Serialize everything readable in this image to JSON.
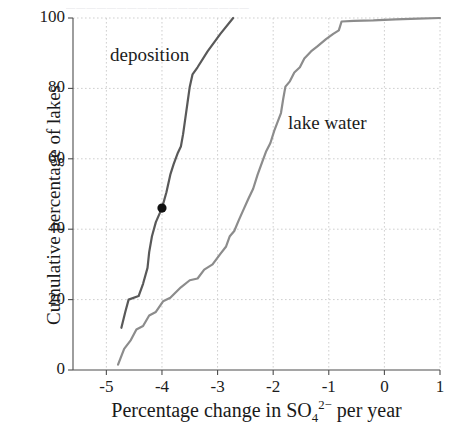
{
  "figure": {
    "top_fragment_text": "▄▄▄▄▄▄▄▄▄▄▄▄▄▄▄▄▄▄"
  },
  "axes": {
    "x_title_prefix": "Percentage change in SO",
    "x_title_sub": "4",
    "x_title_sup": "2−",
    "x_title_suffix": " per year",
    "y_title": "Cumulative percentage of lakes",
    "x_ticks": [
      "-5",
      "-4",
      "-3",
      "-2",
      "-1",
      "0",
      "1"
    ],
    "y_ticks": [
      "0",
      "20",
      "40",
      "60",
      "80",
      "100"
    ]
  },
  "series_labels": {
    "deposition": "deposition",
    "lake_water": "lake water"
  },
  "colors": {
    "deposition": "#595959",
    "lake_water": "#8c8c8c",
    "grid": "#cfcfcf",
    "axis": "#4d4d4d",
    "marker": "#111111",
    "text": "#1c1c1c"
  },
  "chart_data": {
    "type": "line",
    "title": "",
    "xlabel": "Percentage change in SO4 2- per year",
    "ylabel": "Cumulative percentage of lakes",
    "xlim": [
      -5.6,
      1.0
    ],
    "ylim": [
      0,
      100
    ],
    "xticks": [
      -5,
      -4,
      -3,
      -2,
      -1,
      0,
      1
    ],
    "yticks": [
      0,
      20,
      40,
      60,
      80,
      100
    ],
    "grid": true,
    "legend": "inline-annotations",
    "series": [
      {
        "name": "deposition",
        "color": "#595959",
        "points": [
          [
            -4.73,
            12.0
          ],
          [
            -4.66,
            16.5
          ],
          [
            -4.6,
            20.0
          ],
          [
            -4.42,
            21.0
          ],
          [
            -4.34,
            24.5
          ],
          [
            -4.26,
            29.0
          ],
          [
            -4.23,
            33.5
          ],
          [
            -4.18,
            38.0
          ],
          [
            -4.11,
            42.0
          ],
          [
            -4.0,
            46.0
          ],
          [
            -3.92,
            50.5
          ],
          [
            -3.85,
            55.5
          ],
          [
            -3.79,
            58.5
          ],
          [
            -3.72,
            61.5
          ],
          [
            -3.66,
            63.5
          ],
          [
            -3.62,
            67.0
          ],
          [
            -3.58,
            71.5
          ],
          [
            -3.54,
            76.0
          ],
          [
            -3.5,
            80.5
          ],
          [
            -3.45,
            84.0
          ],
          [
            -3.36,
            86.0
          ],
          [
            -3.18,
            90.5
          ],
          [
            -2.95,
            95.5
          ],
          [
            -2.72,
            100.0
          ]
        ],
        "marker_point": [
          -4.0,
          46.0
        ]
      },
      {
        "name": "lake water",
        "color": "#8c8c8c",
        "points": [
          [
            -4.79,
            1.5
          ],
          [
            -4.68,
            6.0
          ],
          [
            -4.56,
            8.5
          ],
          [
            -4.46,
            11.5
          ],
          [
            -4.34,
            12.5
          ],
          [
            -4.23,
            15.5
          ],
          [
            -4.11,
            16.5
          ],
          [
            -3.98,
            19.5
          ],
          [
            -3.85,
            20.5
          ],
          [
            -3.66,
            23.5
          ],
          [
            -3.5,
            25.5
          ],
          [
            -3.36,
            26.0
          ],
          [
            -3.24,
            28.5
          ],
          [
            -3.09,
            30.0
          ],
          [
            -2.95,
            33.0
          ],
          [
            -2.85,
            35.0
          ],
          [
            -2.78,
            38.0
          ],
          [
            -2.7,
            39.5
          ],
          [
            -2.62,
            42.5
          ],
          [
            -2.55,
            45.0
          ],
          [
            -2.45,
            48.5
          ],
          [
            -2.36,
            51.5
          ],
          [
            -2.28,
            55.5
          ],
          [
            -2.2,
            59.0
          ],
          [
            -2.13,
            62.0
          ],
          [
            -2.05,
            64.5
          ],
          [
            -1.98,
            68.0
          ],
          [
            -1.92,
            70.5
          ],
          [
            -1.86,
            73.0
          ],
          [
            -1.82,
            77.0
          ],
          [
            -1.78,
            80.5
          ],
          [
            -1.7,
            82.0
          ],
          [
            -1.62,
            84.5
          ],
          [
            -1.52,
            86.0
          ],
          [
            -1.44,
            88.5
          ],
          [
            -1.32,
            90.5
          ],
          [
            -1.2,
            92.0
          ],
          [
            -1.05,
            94.0
          ],
          [
            -0.92,
            95.5
          ],
          [
            -0.82,
            96.5
          ],
          [
            -0.77,
            99.0
          ],
          [
            -0.55,
            99.2
          ],
          [
            -0.2,
            99.3
          ],
          [
            0.2,
            99.6
          ],
          [
            0.6,
            99.8
          ],
          [
            1.0,
            100.0
          ]
        ]
      }
    ]
  }
}
